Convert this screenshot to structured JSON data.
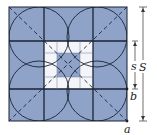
{
  "diagram": {
    "type": "geometric construction",
    "colors": {
      "fill": "#8fa3c9",
      "white": "#f4f5f8",
      "line": "#1a2233",
      "dashed": "#1a2233"
    },
    "labels": {
      "big_side": "S",
      "small_side": "s",
      "point_a": "a",
      "point_b": "b"
    },
    "grid": {
      "rows": 3,
      "cols": 3
    },
    "circles": 4
  }
}
